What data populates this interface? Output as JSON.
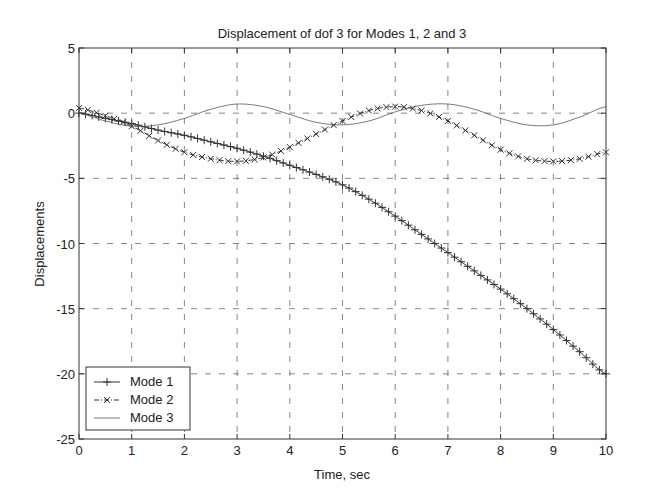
{
  "chart_data": {
    "type": "line",
    "title": "Displacement of dof 3 for Modes 1, 2 and 3",
    "xlabel": "Time, sec",
    "ylabel": "Displacements",
    "xlim": [
      0,
      10
    ],
    "ylim": [
      -25,
      5
    ],
    "xticks": [
      0,
      1,
      2,
      3,
      4,
      5,
      6,
      7,
      8,
      9,
      10
    ],
    "yticks": [
      5,
      0,
      -5,
      -10,
      -15,
      -20,
      -25
    ],
    "grid": true,
    "legend_position": "lower left",
    "x": [
      0,
      0.5,
      1,
      1.5,
      2,
      2.5,
      3,
      3.5,
      4,
      4.5,
      5,
      5.5,
      6,
      6.5,
      7,
      7.5,
      8,
      8.5,
      9,
      9.5,
      10
    ],
    "series": [
      {
        "name": "Mode 1",
        "style": "solid with + markers",
        "values": [
          0.0,
          -0.4,
          -0.8,
          -1.3,
          -1.7,
          -2.2,
          -2.7,
          -3.3,
          -4.0,
          -4.7,
          -5.5,
          -6.6,
          -7.9,
          -9.3,
          -10.7,
          -12.1,
          -13.5,
          -15.0,
          -16.6,
          -18.3,
          -20.0
        ]
      },
      {
        "name": "Mode 2",
        "style": "dash-dot with x markers",
        "values": [
          0.4,
          -0.2,
          -1.0,
          -2.1,
          -3.0,
          -3.5,
          -3.7,
          -3.4,
          -2.6,
          -1.6,
          -0.6,
          0.2,
          0.5,
          0.2,
          -0.6,
          -1.7,
          -2.8,
          -3.5,
          -3.7,
          -3.5,
          -3.0
        ]
      },
      {
        "name": "Mode 3",
        "style": "solid thin",
        "values": [
          0.0,
          -0.6,
          -1.0,
          -0.9,
          -0.4,
          0.3,
          0.7,
          0.5,
          -0.1,
          -0.7,
          -0.9,
          -0.6,
          0.1,
          0.6,
          0.7,
          0.3,
          -0.4,
          -0.9,
          -0.9,
          -0.3,
          0.5
        ]
      }
    ]
  }
}
